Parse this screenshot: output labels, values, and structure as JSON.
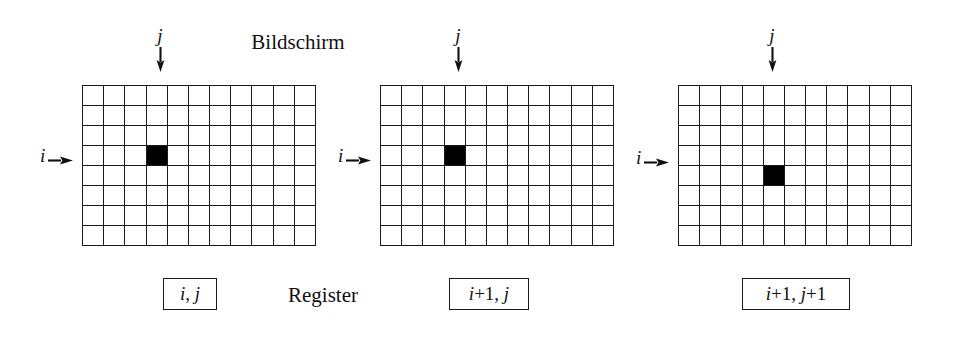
{
  "figure": {
    "title_top": "Bildschirm",
    "title_bottom": "Register",
    "background_color": "#ffffff",
    "line_color": "#1a1a1a",
    "fill_color": "#000000",
    "grid": {
      "columns": 11,
      "rows": 8
    }
  },
  "panels": [
    {
      "id": "panel-1",
      "left": 0,
      "column_label": "j",
      "row_label": "i",
      "j_arrow_x": 160,
      "i_arrow_y": 144,
      "highlight": {
        "col": 3,
        "row": 3
      },
      "register_label": "i, j",
      "register_parts": {
        "row": "i",
        "row_delta": "",
        "col": "j",
        "col_delta": ""
      },
      "register_box_left": 163,
      "register_box_width": 54
    },
    {
      "id": "panel-2",
      "left": 298,
      "column_label": "j",
      "row_label": "i",
      "j_arrow_x": 160,
      "i_arrow_y": 144,
      "highlight": {
        "col": 3,
        "row": 3
      },
      "register_label": "i+1, j",
      "register_parts": {
        "row": "i",
        "row_delta": "+1",
        "col": "j",
        "col_delta": ""
      },
      "register_box_left": 151,
      "register_box_width": 80
    },
    {
      "id": "panel-3",
      "left": 596,
      "column_label": "j",
      "row_label": "i",
      "j_arrow_x": 176,
      "i_arrow_y": 146,
      "highlight": {
        "col": 4,
        "row": 4
      },
      "register_label": "i+1, j+1",
      "register_parts": {
        "row": "i",
        "row_delta": "+1",
        "col": "j",
        "col_delta": "+1"
      },
      "register_box_left": 146,
      "register_box_width": 108
    }
  ],
  "icons": {
    "arrow_down": "arrow-down-icon",
    "arrow_right": "arrow-right-icon"
  }
}
